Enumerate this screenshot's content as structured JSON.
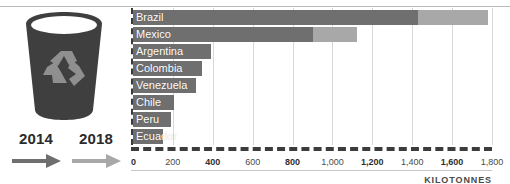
{
  "legend": {
    "items": [
      {
        "year": "2014",
        "color": "#6f6f6f",
        "arrow_icon": "arrow-right-icon"
      },
      {
        "year": "2018",
        "color": "#a8a8a8",
        "arrow_icon": "arrow-right-icon"
      }
    ]
  },
  "illustration": {
    "bin_icon": "recycling-bin-icon",
    "bin_color": "#3f3f3f",
    "symbol_icon": "recycling-symbol-icon",
    "symbol_color": "#8f8f8f"
  },
  "axis": {
    "unit_label": "KILOTONNES",
    "ticks": [
      "0",
      "200",
      "400",
      "600",
      "800",
      "1,000",
      "1,200",
      "1,400",
      "1,600",
      "1,800"
    ]
  },
  "chart_data": {
    "type": "bar",
    "orientation": "horizontal",
    "title": "",
    "xlabel": "KILOTONNES",
    "ylabel": "",
    "xlim": [
      0,
      1800
    ],
    "grid": true,
    "legend_position": "left",
    "categories": [
      "Brazil",
      "Mexico",
      "Argentina",
      "Colombia",
      "Venezuela",
      "Chile",
      "Peru",
      "Ecuador"
    ],
    "series": [
      {
        "name": "2014",
        "color": "#6f6f6f",
        "values": [
          1430,
          900,
          390,
          345,
          315,
          205,
          190,
          150
        ]
      },
      {
        "name": "2018",
        "color": "#a8a8a8",
        "values": [
          1780,
          1125,
          390,
          345,
          315,
          205,
          190,
          150
        ]
      }
    ]
  }
}
